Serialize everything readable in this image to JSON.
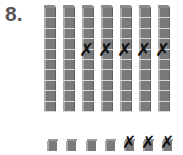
{
  "problem": {
    "number_label": "8."
  },
  "tens_rods": {
    "count": 7,
    "cubes_per_rod": 10,
    "crossed_out": [
      false,
      false,
      true,
      true,
      true,
      true,
      true
    ],
    "cross_symbol": "✗",
    "x_positions": [
      44,
      63,
      82,
      101,
      120,
      139,
      158
    ]
  },
  "unit_cubes": {
    "count": 7,
    "crossed_out": [
      false,
      false,
      false,
      false,
      true,
      true,
      true
    ],
    "cross_symbol": "✗",
    "x_positions": [
      47,
      66,
      86,
      105,
      124,
      143,
      162
    ]
  },
  "colors": {
    "block_fill": "#7a7a7a",
    "block_highlight": "#a9a9a9",
    "segment_line": "#d8d8d8",
    "cross_mark": "#111111",
    "number_text": "#555555"
  }
}
